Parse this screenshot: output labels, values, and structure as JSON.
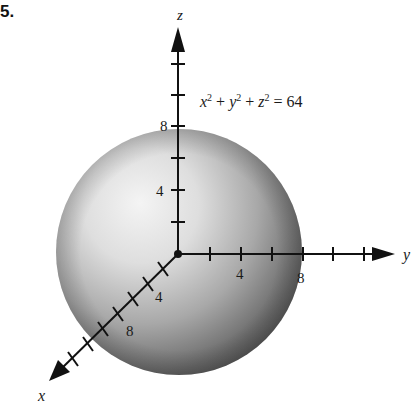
{
  "problem_number": "5.",
  "equation": {
    "text": "x² + y² + z² = 64",
    "parts": [
      "x",
      "2",
      " + ",
      "y",
      "2",
      " + ",
      "z",
      "2",
      " = 64"
    ]
  },
  "axes": {
    "x": {
      "label": "x",
      "tick_labels": [
        "4",
        "8"
      ]
    },
    "y": {
      "label": "y",
      "tick_labels": [
        "4",
        "8"
      ]
    },
    "z": {
      "label": "z",
      "tick_labels": [
        "4",
        "8"
      ]
    }
  },
  "sphere": {
    "radius": 8,
    "shading": {
      "highlight": "#f2f2f2",
      "mid": "#bdbdbd",
      "shadow": "#4a4a4a"
    }
  }
}
